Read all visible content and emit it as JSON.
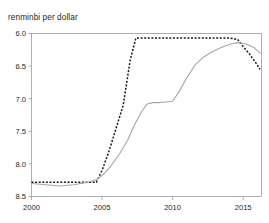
{
  "chart_data": {
    "type": "line",
    "title": "",
    "subtitle": "renminbi per dollar",
    "xlabel": "",
    "ylabel": "renminbi per dollar",
    "y_inverted": true,
    "ylim": [
      6.0,
      8.5
    ],
    "xlim": [
      2000,
      2016.3
    ],
    "yticks": [
      "6.0",
      "6.5",
      "7.0",
      "7.5",
      "8.0",
      "8.5"
    ],
    "ytick_values": [
      6.0,
      6.5,
      7.0,
      7.5,
      8.0,
      8.5
    ],
    "xticks": [
      "2000",
      "2005",
      "2010",
      "2015"
    ],
    "xtick_values": [
      2000,
      2005,
      2010,
      2015
    ],
    "grid": false,
    "legend": "none",
    "series": [
      {
        "name": "nominal-dashed",
        "style": "dashed",
        "color": "#1a1a1a",
        "x": [
          2000.0,
          2001.0,
          2002.0,
          2003.0,
          2004.0,
          2004.6,
          2005.0,
          2005.5,
          2006.0,
          2006.5,
          2007.0,
          2007.4,
          2008.0,
          2009.0,
          2010.0,
          2011.0,
          2012.0,
          2013.0,
          2014.0,
          2014.6,
          2015.0,
          2015.4,
          2015.8,
          2016.2
        ],
        "y": [
          8.28,
          8.28,
          8.28,
          8.28,
          8.28,
          8.28,
          8.1,
          7.8,
          7.45,
          7.1,
          6.4,
          6.07,
          6.07,
          6.07,
          6.07,
          6.07,
          6.07,
          6.07,
          6.07,
          6.09,
          6.2,
          6.3,
          6.42,
          6.55
        ]
      },
      {
        "name": "real-solid",
        "style": "solid",
        "color": "#a6a6a6",
        "x": [
          2000.0,
          2001.0,
          2002.0,
          2003.0,
          2004.0,
          2004.6,
          2005.0,
          2005.6,
          2006.2,
          2006.8,
          2007.3,
          2007.8,
          2008.2,
          2008.6,
          2009.0,
          2009.5,
          2010.0,
          2010.5,
          2011.0,
          2011.6,
          2012.2,
          2012.8,
          2013.4,
          2014.0,
          2014.6,
          2015.2,
          2015.8,
          2016.2
        ],
        "y": [
          8.3,
          8.32,
          8.34,
          8.32,
          8.28,
          8.24,
          8.18,
          8.04,
          7.86,
          7.64,
          7.4,
          7.2,
          7.08,
          7.06,
          7.06,
          7.05,
          7.04,
          6.88,
          6.68,
          6.48,
          6.36,
          6.28,
          6.22,
          6.17,
          6.14,
          6.16,
          6.22,
          6.3
        ]
      }
    ]
  }
}
